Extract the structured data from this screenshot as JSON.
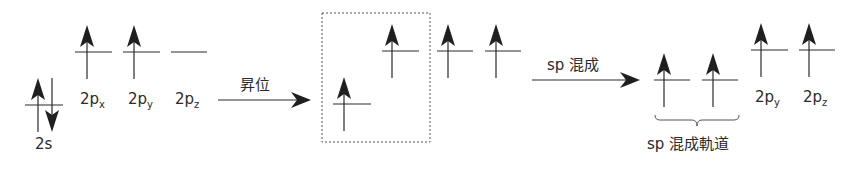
{
  "diagram": {
    "colors": {
      "line": "#2a2a2a",
      "arrow": "#1f1f1f",
      "dashed_box": "#555555"
    },
    "ground_state": {
      "orbitals": [
        {
          "name": "2s",
          "label_main": "2s",
          "label_sub": "",
          "electrons": [
            "up",
            "down"
          ]
        },
        {
          "name": "2px",
          "label_main": "2p",
          "label_sub": "x",
          "electrons": [
            "up"
          ]
        },
        {
          "name": "2py",
          "label_main": "2p",
          "label_sub": "y",
          "electrons": [
            "up"
          ]
        },
        {
          "name": "2pz",
          "label_main": "2p",
          "label_sub": "z",
          "electrons": []
        }
      ]
    },
    "step1": {
      "label": "昇位",
      "arrow": "right-arrow"
    },
    "excited_state": {
      "orbitals": [
        {
          "name": "2s",
          "electrons": [
            "up"
          ],
          "boxed": true
        },
        {
          "name": "2px",
          "electrons": [
            "up"
          ],
          "boxed": true
        },
        {
          "name": "2py",
          "electrons": [
            "up"
          ]
        },
        {
          "name": "2pz",
          "electrons": [
            "up"
          ]
        }
      ]
    },
    "step2": {
      "label": "sp 混成",
      "arrow": "right-arrow"
    },
    "hybrid_state": {
      "hybrid_orbitals": [
        {
          "name": "sp",
          "electrons": [
            "up"
          ]
        },
        {
          "name": "sp",
          "electrons": [
            "up"
          ]
        }
      ],
      "hybrid_label": "sp 混成軌道",
      "remaining": [
        {
          "name": "2py",
          "label_main": "2p",
          "label_sub": "y",
          "electrons": [
            "up"
          ]
        },
        {
          "name": "2pz",
          "label_main": "2p",
          "label_sub": "z",
          "electrons": [
            "up"
          ]
        }
      ]
    }
  }
}
